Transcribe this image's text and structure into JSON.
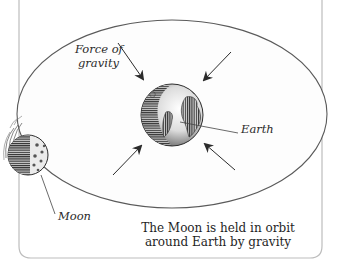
{
  "diagram": {
    "title": "The Moon is held in orbit around Earth by gravity",
    "caption_lines": [
      "The Moon is held in orbit",
      "around Earth by gravity"
    ],
    "labels": {
      "force": [
        "Force of",
        "gravity"
      ],
      "earth": "Earth",
      "moon": "Moon"
    },
    "colors": {
      "frame": "#b8b8b8",
      "orbit": "#5a5a5a",
      "arrow": "#2b2b2b",
      "earth_dark": "#3a3a3a",
      "earth_light": "#f2f2f2",
      "moon_dark": "#3d3d3d",
      "moon_light": "#e8e8e8",
      "background": "#ffffff"
    },
    "elements": [
      {
        "name": "orbit-ellipse",
        "cx": 172,
        "cy": 114,
        "rx": 155,
        "ry": 94
      },
      {
        "name": "earth",
        "cx": 172,
        "cy": 115,
        "r": 31
      },
      {
        "name": "moon",
        "cx": 28,
        "cy": 155,
        "r": 20
      }
    ],
    "arrows": [
      {
        "name": "gravity-arrow-top-left",
        "from": [
          118,
          43
        ],
        "to": [
          143,
          79
        ]
      },
      {
        "name": "gravity-arrow-top-right",
        "from": [
          231,
          52
        ],
        "to": [
          204,
          80
        ]
      },
      {
        "name": "gravity-arrow-bottom-left",
        "from": [
          113,
          175
        ],
        "to": [
          141,
          146
        ]
      },
      {
        "name": "gravity-arrow-bottom-right",
        "from": [
          235,
          170
        ],
        "to": [
          205,
          144
        ]
      }
    ]
  }
}
